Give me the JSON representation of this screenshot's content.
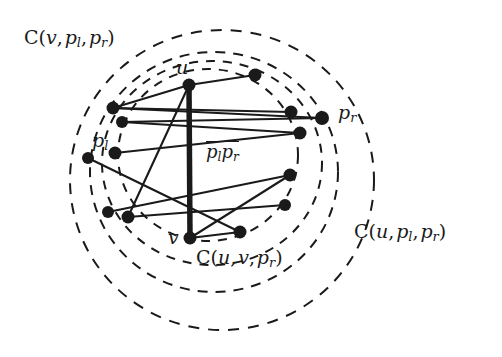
{
  "figure": {
    "type": "geometry-diagram",
    "background_color": "#ffffff",
    "ink_color": "#1a1a1a",
    "width": 502,
    "height": 357,
    "labels": {
      "circle_v_pl_pr": {
        "text": "C(v, p_l, p_r)",
        "render": "C(v,&thinsp;p",
        "x": 24,
        "y": 28,
        "font_size": 19
      },
      "circle_u_pl_pr": {
        "text": "C(u, p_l, p_r)",
        "x": 354,
        "y": 222,
        "font_size": 19
      },
      "circle_u_v_pr": {
        "text": "C(u, v, p_r)",
        "x": 196,
        "y": 248,
        "font_size": 19
      },
      "vertex_u": {
        "text": "u",
        "x": 176,
        "y": 58,
        "font_size": 19
      },
      "vertex_v": {
        "text": "v",
        "x": 168,
        "y": 228,
        "font_size": 19
      },
      "point_pl": {
        "text": "p_l",
        "x": 92,
        "y": 131,
        "font_size": 19
      },
      "point_pr": {
        "text": "p_r",
        "x": 338,
        "y": 103,
        "font_size": 19
      },
      "segment_plpr": {
        "text": "p_l p_r",
        "x": 206,
        "y": 141,
        "font_size": 18
      }
    },
    "segment_uv": {
      "name": "thick-segment-uv",
      "x1": 189,
      "y1": 85,
      "x2": 190,
      "y2": 238,
      "stroke_width": 5.5
    },
    "vertices": {
      "u": {
        "x": 189,
        "y": 85,
        "r": 6.5
      },
      "v": {
        "x": 190,
        "y": 238,
        "r": 6.5
      }
    },
    "points_left": [
      {
        "name": "left-point-1",
        "x": 113,
        "y": 108,
        "r": 6.5
      },
      {
        "name": "left-point-2",
        "x": 122,
        "y": 122,
        "r": 6
      },
      {
        "name": "left-point-pl",
        "x": 115,
        "y": 153,
        "r": 6.5
      },
      {
        "name": "left-point-4",
        "x": 88,
        "y": 158,
        "r": 6
      },
      {
        "name": "left-point-5",
        "x": 108,
        "y": 212,
        "r": 6
      },
      {
        "name": "left-point-6",
        "x": 128,
        "y": 217,
        "r": 6.5
      }
    ],
    "points_right": [
      {
        "name": "right-point-1",
        "x": 255,
        "y": 75,
        "r": 6.5
      },
      {
        "name": "right-point-2",
        "x": 291,
        "y": 112,
        "r": 6.5
      },
      {
        "name": "right-point-pr",
        "x": 322,
        "y": 118,
        "r": 7
      },
      {
        "name": "right-point-4",
        "x": 300,
        "y": 133,
        "r": 6.5
      },
      {
        "name": "right-point-5",
        "x": 290,
        "y": 175,
        "r": 6.5
      },
      {
        "name": "right-point-6",
        "x": 285,
        "y": 205,
        "r": 6
      },
      {
        "name": "right-point-7",
        "x": 240,
        "y": 232,
        "r": 6.5
      }
    ],
    "edges": [
      {
        "name": "edge-u-r1",
        "x1": 189,
        "y1": 85,
        "x2": 255,
        "y2": 75
      },
      {
        "name": "edge-l1-u",
        "x1": 113,
        "y1": 108,
        "x2": 189,
        "y2": 85
      },
      {
        "name": "edge-l1-r2",
        "x1": 113,
        "y1": 108,
        "x2": 291,
        "y2": 112
      },
      {
        "name": "edge-l1-pr",
        "x1": 113,
        "y1": 108,
        "x2": 322,
        "y2": 118
      },
      {
        "name": "edge-l2-pr",
        "x1": 122,
        "y1": 122,
        "x2": 322,
        "y2": 118
      },
      {
        "name": "edge-l2-r4",
        "x1": 122,
        "y1": 122,
        "x2": 300,
        "y2": 133
      },
      {
        "name": "edge-pl-r4",
        "x1": 115,
        "y1": 153,
        "x2": 300,
        "y2": 133
      },
      {
        "name": "edge-l4-r7",
        "x1": 88,
        "y1": 158,
        "x2": 240,
        "y2": 232
      },
      {
        "name": "edge-l5-r5",
        "x1": 108,
        "y1": 212,
        "x2": 290,
        "y2": 175
      },
      {
        "name": "edge-l6-r6",
        "x1": 128,
        "y1": 217,
        "x2": 285,
        "y2": 205
      },
      {
        "name": "edge-l6-u",
        "x1": 128,
        "y1": 217,
        "x2": 189,
        "y2": 85
      },
      {
        "name": "edge-v-r7",
        "x1": 190,
        "y1": 238,
        "x2": 240,
        "y2": 232
      },
      {
        "name": "edge-v-r5",
        "x1": 190,
        "y1": 238,
        "x2": 290,
        "y2": 175
      }
    ],
    "circles": [
      {
        "name": "circle-outer-v-pl-pr",
        "cx": 222,
        "cy": 180,
        "rx": 152,
        "ry": 150,
        "rotation": 0,
        "dash": "11 9"
      },
      {
        "name": "circle-u-pl-pr",
        "cx": 214,
        "cy": 172,
        "rx": 124,
        "ry": 120,
        "rotation": 0,
        "dash": "10 8"
      },
      {
        "name": "circle-u-v-pr",
        "cx": 212,
        "cy": 163,
        "rx": 110,
        "ry": 102,
        "rotation": 0,
        "dash": "9 8"
      },
      {
        "name": "circle-inner-small",
        "cx": 208,
        "cy": 155,
        "rx": 90,
        "ry": 86,
        "rotation": 0,
        "dash": "9 8"
      }
    ]
  }
}
